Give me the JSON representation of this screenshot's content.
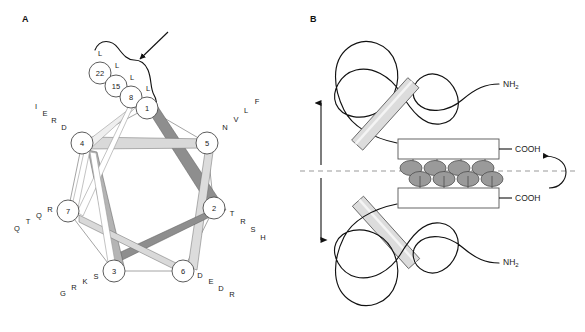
{
  "figure": {
    "panels": [
      {
        "id": "A",
        "label": "A"
      },
      {
        "id": "B",
        "label": "B"
      }
    ]
  },
  "panel_a": {
    "label": "A",
    "description": "helical-wheel-diagram",
    "heptad_positions": [
      {
        "position": "1",
        "label": "1",
        "cx": 147,
        "cy": 108
      },
      {
        "position": "2",
        "label": "2",
        "cx": 214,
        "cy": 208
      },
      {
        "position": "3",
        "label": "3",
        "cx": 114,
        "cy": 271
      },
      {
        "position": "4",
        "label": "4",
        "cx": 82,
        "cy": 143
      },
      {
        "position": "5",
        "label": "5",
        "cx": 207,
        "cy": 143
      },
      {
        "position": "6",
        "label": "6",
        "cx": 183,
        "cy": 271
      },
      {
        "position": "7",
        "label": "7",
        "cx": 68,
        "cy": 211
      }
    ],
    "leucine_stack": [
      {
        "number": "22",
        "residue": "L",
        "cx": 100,
        "cy": 73,
        "lx": 100,
        "ly": 53
      },
      {
        "number": "15",
        "residue": "L",
        "cx": 116,
        "cy": 86,
        "lx": 117,
        "ly": 65
      },
      {
        "number": "8",
        "residue": "L",
        "cx": 131,
        "cy": 97,
        "lx": 132,
        "ly": 77
      },
      {
        "number": "1",
        "residue": "L",
        "cx": 147,
        "cy": 108,
        "lx": 148,
        "ly": 88
      }
    ],
    "residue_labels": [
      {
        "position": "4",
        "letters": [
          "D",
          "R",
          "E",
          "I"
        ],
        "points": [
          [
            64,
            127
          ],
          [
            54,
            120
          ],
          [
            45,
            113
          ],
          [
            36,
            106
          ]
        ]
      },
      {
        "position": "5",
        "letters": [
          "N",
          "V",
          "L",
          "F"
        ],
        "points": [
          [
            225,
            127
          ],
          [
            236,
            119
          ],
          [
            246,
            110
          ],
          [
            257,
            101
          ]
        ]
      },
      {
        "position": "2",
        "letters": [
          "T",
          "R",
          "S",
          "H"
        ],
        "points": [
          [
            232,
            213
          ],
          [
            243,
            221
          ],
          [
            253,
            229
          ],
          [
            263,
            237
          ]
        ]
      },
      {
        "position": "6",
        "letters": [
          "D",
          "E",
          "D",
          "R"
        ],
        "points": [
          [
            200,
            275
          ],
          [
            211,
            281
          ],
          [
            221,
            288
          ],
          [
            232,
            294
          ]
        ]
      },
      {
        "position": "3",
        "letters": [
          "S",
          "K",
          "R",
          "G"
        ],
        "points": [
          [
            96,
            276
          ],
          [
            85,
            281
          ],
          [
            74,
            287
          ],
          [
            63,
            293
          ]
        ]
      },
      {
        "position": "7",
        "letters": [
          "R",
          "Q",
          "T",
          "Q"
        ],
        "points": [
          [
            50,
            209
          ],
          [
            39,
            215
          ],
          [
            28,
            221
          ],
          [
            17,
            228
          ]
        ]
      }
    ],
    "annotations": {
      "arrow": "pointer-to-leucine-repeat",
      "bracket": "leucine-repeat-bracket"
    }
  },
  "panel_b": {
    "label": "B",
    "description": "coiled-coil-dimer-schematic",
    "terminals": [
      {
        "id": "nh2-top",
        "text": "NH",
        "sub": "2",
        "x": 503,
        "y": 84
      },
      {
        "id": "cooh-top",
        "text": "COOH",
        "x": 515,
        "y": 146
      },
      {
        "id": "cooh-bottom",
        "text": "COOH",
        "x": 515,
        "y": 196
      },
      {
        "id": "nh2-bottom",
        "text": "NH",
        "sub": "2",
        "x": 503,
        "y": 262
      }
    ],
    "leucine_pairs_count": 4,
    "axis": {
      "type": "dashed-dyad-axis",
      "y": 171
    },
    "arrows": {
      "vertical": "two-fold-translation-arrow",
      "rotation": "two-fold-rotation-arrow"
    },
    "colors": {
      "helix_fill": "#dcdcdc",
      "leucine_fill": "#9a9a9a",
      "axis": "#8d8d8d",
      "outline": "#222222"
    }
  }
}
